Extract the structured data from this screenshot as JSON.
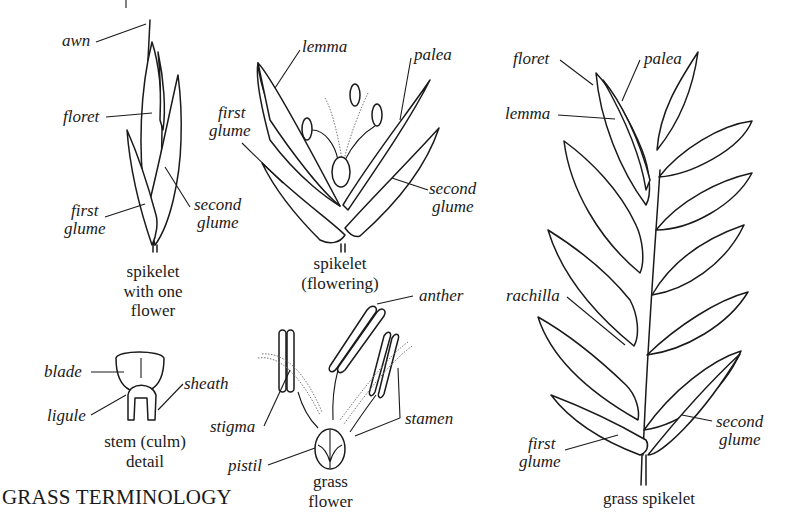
{
  "title": "GRASS TERMINOLOGY",
  "colors": {
    "ink": "#1a1a1a",
    "background": "#ffffff"
  },
  "panels": {
    "spikelet_one_flower": {
      "caption": [
        "spikelet",
        "with one",
        "flower"
      ],
      "labels": {
        "awn": "awn",
        "floret": "floret",
        "first_glume": [
          "first",
          "glume"
        ],
        "second_glume": [
          "second",
          "glume"
        ]
      }
    },
    "spikelet_flowering": {
      "caption": [
        "spikelet",
        "(flowering)"
      ],
      "labels": {
        "lemma": "lemma",
        "palea": "palea",
        "first_glume": [
          "first",
          "glume"
        ],
        "second_glume": [
          "second",
          "glume"
        ]
      }
    },
    "stem_detail": {
      "caption": [
        "stem (culm)",
        "detail"
      ],
      "labels": {
        "blade": "blade",
        "sheath": "sheath",
        "ligule": "ligule"
      }
    },
    "grass_flower": {
      "caption": [
        "grass",
        "flower"
      ],
      "labels": {
        "anther": "anther",
        "stigma": "stigma",
        "stamen": "stamen",
        "pistil": "pistil"
      }
    },
    "grass_spikelet": {
      "caption": [
        "grass spikelet"
      ],
      "labels": {
        "floret": "floret",
        "palea": "palea",
        "lemma": "lemma",
        "rachilla": "rachilla",
        "first_glume": [
          "first",
          "glume"
        ],
        "second_glume": [
          "second",
          "glume"
        ]
      }
    }
  }
}
